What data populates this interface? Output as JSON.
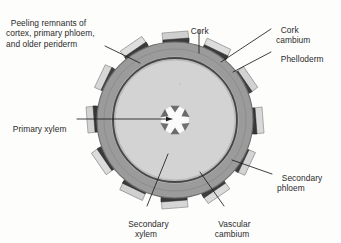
{
  "figure": {
    "type": "botanical-cross-section-diagram",
    "background_color": "#fdfdfc"
  },
  "labels": [
    {
      "id": "peeling-remnants",
      "text": "Peeling remnants of\ncortex, primary phloem,\nand older periderm",
      "lines": [
        "Peeling remnants of",
        "cortex, primary phloem,",
        "and older periderm"
      ],
      "position": "top-left"
    },
    {
      "id": "cork",
      "text": "Cork",
      "lines": [
        "Cork"
      ],
      "position": "top-center"
    },
    {
      "id": "cork-cambium",
      "text": "Cork\ncambium",
      "lines": [
        "Cork",
        "cambium"
      ],
      "position": "top-right"
    },
    {
      "id": "phelloderm",
      "text": "Phelloderm",
      "lines": [
        "Phelloderm"
      ],
      "position": "top-right"
    },
    {
      "id": "primary-xylem",
      "text": "Primary xylem",
      "lines": [
        "Primary xylem"
      ],
      "position": "left-middle"
    },
    {
      "id": "secondary-phloem",
      "text": "Secondary\nphloem",
      "lines": [
        "Secondary",
        "phloem"
      ],
      "position": "right-lower"
    },
    {
      "id": "secondary-xylem",
      "text": "Secondary\nxylem",
      "lines": [
        "Secondary",
        "xylem"
      ],
      "position": "bottom-left"
    },
    {
      "id": "vascular-cambium",
      "text": "Vascular\ncambium",
      "lines": [
        "Vascular",
        "cambium"
      ],
      "position": "bottom-center"
    }
  ],
  "colors": {
    "secondary_phloem_ring": "#9b9b9b",
    "phloem_ring_edge": "#6f6f6f",
    "vascular_cambium_line": "#4a4a4a",
    "secondary_xylem_disc": "#d3d3d3",
    "pith_center": "#fbfbfb",
    "primary_xylem_wedge": "#6a6a6a",
    "cork_dark": "#3a3a3a",
    "phelloderm_light": "#dcdcdc",
    "flap_mid_grey": "#a8a8a8",
    "leader_line": "#1d1d1d",
    "text": "#2b2b2b"
  },
  "geometry": {
    "center_x": 175,
    "center_y": 120,
    "outer_radius": 78,
    "phloem_inner_radius": 63,
    "cambium_radius": 62,
    "xylem_radius": 60,
    "pith_radius": 14,
    "primary_xylem_arms": 6,
    "bark_flap_count": 12
  }
}
